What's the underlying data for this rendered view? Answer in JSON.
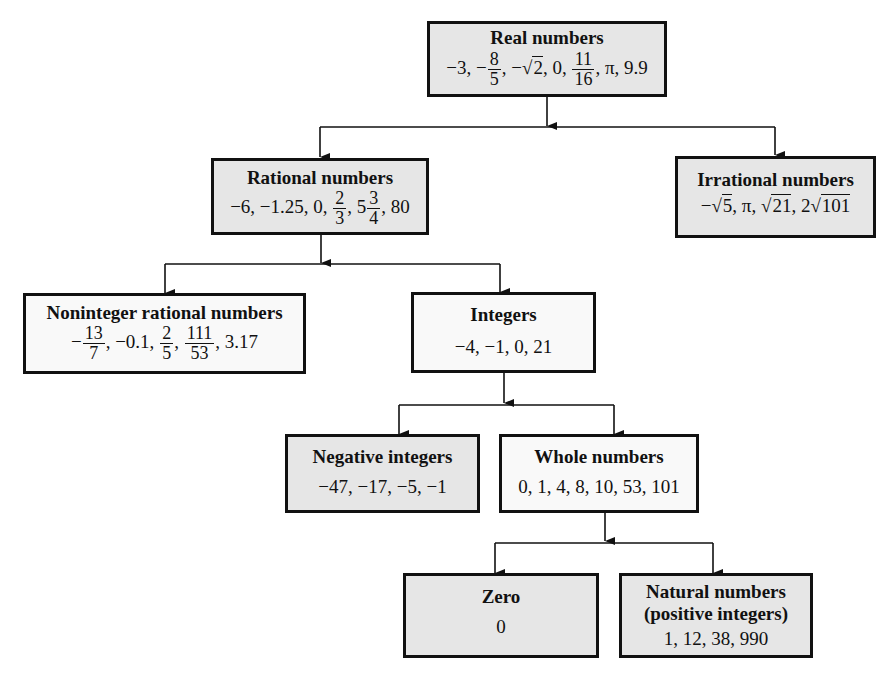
{
  "diagram": {
    "nodes": {
      "real": {
        "title": "Real numbers",
        "values": [
          "−3",
          "−8/5",
          "−√2",
          "0",
          "11/16",
          "π",
          "9.9"
        ]
      },
      "rational": {
        "title": "Rational numbers",
        "values": [
          "−6",
          "−1.25",
          "0",
          "2/3",
          "5 3/4",
          "80"
        ]
      },
      "irrational": {
        "title": "Irrational numbers",
        "values": [
          "−√5",
          "π",
          "√21",
          "2√101"
        ]
      },
      "noninteger": {
        "title": "Noninteger rational numbers",
        "values": [
          "−13/7",
          "−0.1",
          "2/5",
          "111/53",
          "3.17"
        ]
      },
      "integers": {
        "title": "Integers",
        "values_text": "−4, −1, 0, 21"
      },
      "negative": {
        "title": "Negative integers",
        "values_text": "−47, −17, −5, −1"
      },
      "whole": {
        "title": "Whole numbers",
        "values_text": "0, 1, 4, 8, 10, 53, 101"
      },
      "zero": {
        "title": "Zero",
        "values_text": "0"
      },
      "natural": {
        "title": "Natural numbers",
        "subtitle": "(positive integers)",
        "values_text": "1, 12, 38, 990"
      }
    },
    "edges": [
      [
        "real",
        "rational"
      ],
      [
        "real",
        "irrational"
      ],
      [
        "rational",
        "noninteger"
      ],
      [
        "rational",
        "integers"
      ],
      [
        "integers",
        "negative"
      ],
      [
        "integers",
        "whole"
      ],
      [
        "whole",
        "zero"
      ],
      [
        "whole",
        "natural"
      ]
    ],
    "frac": {
      "real_8_5": {
        "n": "8",
        "d": "5"
      },
      "real_11_16": {
        "n": "11",
        "d": "16"
      },
      "rat_2_3": {
        "n": "2",
        "d": "3"
      },
      "rat_3_4": {
        "n": "3",
        "d": "4"
      },
      "non_13_7": {
        "n": "13",
        "d": "7"
      },
      "non_2_5": {
        "n": "2",
        "d": "5"
      },
      "non_111_53": {
        "n": "111",
        "d": "53"
      }
    },
    "text": {
      "real_a": "−3, −",
      "real_b": ", −",
      "real_sqrt2": "2",
      "real_c": ", 0, ",
      "real_d": ", π, 9.9",
      "rat_a": "−6, −1.25, 0, ",
      "rat_b": ", 5",
      "rat_c": ", 80",
      "irr_a": "−",
      "irr_r5": "5",
      "irr_b": ", π, ",
      "irr_r21": "21",
      "irr_c": ", 2",
      "irr_r101": "101",
      "non_a": "−",
      "non_b": ", −0.1, ",
      "non_c": ", ",
      "non_d": ", 3.17",
      "sqrt_sign": "√"
    },
    "colors": {
      "gray_fill": "#e6e6e6",
      "white_fill": "#f9f9f9",
      "line": "#111111"
    }
  }
}
